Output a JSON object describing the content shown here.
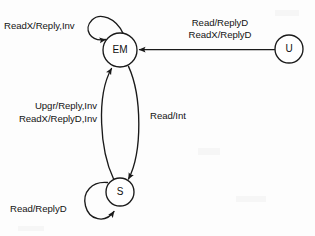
{
  "diagram": {
    "type": "state-machine",
    "background_color": "#fdfdfd",
    "stroke_color": "#1a1a1a",
    "text_color": "#141414",
    "nodes": [
      {
        "id": "EM",
        "label": "EM",
        "cx": 120,
        "cy": 50,
        "r": 17
      },
      {
        "id": "S",
        "label": "S",
        "cx": 120,
        "cy": 192,
        "r": 14
      },
      {
        "id": "U",
        "label": "U",
        "cx": 289,
        "cy": 49,
        "r": 14
      }
    ],
    "edges": [
      {
        "id": "em-self",
        "from": "EM",
        "to": "EM",
        "kind": "self-loop",
        "label": "ReadX/Reply,Inv"
      },
      {
        "id": "u-to-em",
        "from": "U",
        "to": "EM",
        "kind": "straight",
        "label_line1": "Read/ReplyD",
        "label_line2": "ReadX/ReplyD"
      },
      {
        "id": "s-to-em",
        "from": "S",
        "to": "EM",
        "kind": "curve-left",
        "label_line1": "Upgr/Reply,Inv",
        "label_line2": "ReadX/ReplyD,Inv"
      },
      {
        "id": "em-to-s",
        "from": "EM",
        "to": "S",
        "kind": "curve-right",
        "label": "Read/Int"
      },
      {
        "id": "s-self",
        "from": "S",
        "to": "S",
        "kind": "self-loop",
        "label": "Read/ReplyD"
      }
    ],
    "labels": {
      "em_self_loop": "ReadX/Reply,Inv",
      "u_to_em_line1": "Read/ReplyD",
      "u_to_em_line2": "ReadX/ReplyD",
      "s_to_em_line1": "Upgr/Reply,Inv",
      "s_to_em_line2": "ReadX/ReplyD,Inv",
      "em_to_s": "Read/Int",
      "s_self_loop": "Read/ReplyD"
    },
    "node_labels": {
      "em": "EM",
      "s": "S",
      "u": "U"
    }
  }
}
